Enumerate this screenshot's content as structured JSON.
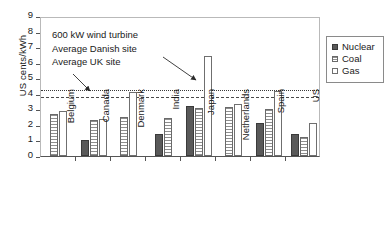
{
  "chart_data": {
    "type": "bar",
    "title": "",
    "xlabel": "",
    "ylabel": "US cents/kWh",
    "ylim": [
      0,
      9
    ],
    "ytick_labels": [
      "0",
      "1",
      "2",
      "3",
      "4",
      "5",
      "6",
      "7",
      "8",
      "9"
    ],
    "grid": false,
    "legend_position": "right",
    "categories": [
      "Belgium",
      "Canada",
      "Denmark",
      "India",
      "Japan",
      "Netherlands",
      "Spain",
      "US"
    ],
    "series": [
      {
        "name": "Nuclear",
        "color": "#595959",
        "values": [
          null,
          1.0,
          null,
          1.4,
          3.2,
          null,
          2.1,
          1.4
        ]
      },
      {
        "name": "Coal",
        "color": "#e8e8e8",
        "values": [
          2.7,
          2.3,
          2.5,
          2.45,
          3.1,
          3.15,
          3.05,
          1.25
        ]
      },
      {
        "name": "Gas",
        "color": "#ffffff",
        "values": [
          2.9,
          2.35,
          4.1,
          null,
          6.4,
          3.35,
          4.2,
          2.1
        ]
      }
    ],
    "reference_lines": [
      {
        "label": "Average UK site",
        "value": 4.4,
        "style": "dotted"
      },
      {
        "label": "Average Danish site",
        "value": 3.9,
        "style": "dashed"
      }
    ],
    "annotations": [
      "600 kW wind turbine",
      "Average Danish site",
      "Average UK site"
    ]
  },
  "legend": {
    "items": [
      {
        "label": "Nuclear",
        "swatch": "nuclear"
      },
      {
        "label": "Coal",
        "swatch": "coal"
      },
      {
        "label": "Gas",
        "swatch": "gas"
      }
    ]
  }
}
